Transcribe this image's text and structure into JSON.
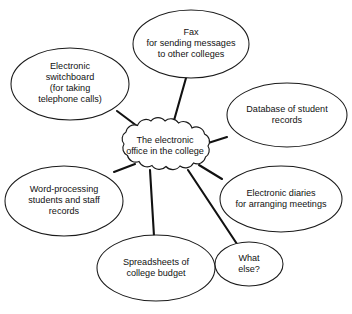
{
  "diagram": {
    "type": "spider-diagram",
    "title": "The electronic office in the college",
    "center": {
      "id": "center-cloud",
      "shape": "cloud",
      "lines": [
        "The electronic",
        "office in the college"
      ],
      "cx": 165,
      "cy": 146,
      "rx": 53,
      "ry": 24
    },
    "nodes": [
      {
        "id": "electronic-switchboard",
        "shape": "ellipse",
        "lines": [
          "Electronic",
          "switchboard",
          "(for taking",
          "telephone calls)"
        ],
        "cx": 70,
        "cy": 84,
        "rx": 59,
        "ry": 36
      },
      {
        "id": "fax",
        "shape": "ellipse",
        "lines": [
          "Fax",
          "for sending messages",
          "to other colleges"
        ],
        "cx": 191,
        "cy": 44,
        "rx": 58,
        "ry": 34
      },
      {
        "id": "database-of-student-records",
        "shape": "ellipse",
        "lines": [
          "Database of student",
          "records"
        ],
        "cx": 287,
        "cy": 115,
        "rx": 60,
        "ry": 32
      },
      {
        "id": "word-processing",
        "shape": "ellipse",
        "lines": [
          "Word-processing",
          "students and staff",
          "records"
        ],
        "cx": 64,
        "cy": 201,
        "rx": 59,
        "ry": 35
      },
      {
        "id": "electronic-diaries",
        "shape": "ellipse",
        "lines": [
          "Electronic diaries",
          "for arranging meetings"
        ],
        "cx": 281,
        "cy": 199,
        "rx": 61,
        "ry": 33
      },
      {
        "id": "spreadsheets",
        "shape": "ellipse",
        "lines": [
          "Spreadsheets of",
          "college budget"
        ],
        "cx": 156,
        "cy": 268,
        "rx": 59,
        "ry": 33
      },
      {
        "id": "what-else",
        "shape": "ellipse",
        "lines": [
          "What",
          "else?"
        ],
        "cx": 249,
        "cy": 264,
        "rx": 34,
        "ry": 22
      }
    ],
    "connectors": [
      {
        "id": "link-switchboard",
        "from": "electronic-switchboard",
        "x1": 117,
        "y1": 111,
        "x2": 137,
        "y2": 126
      },
      {
        "id": "link-fax",
        "from": "fax",
        "x1": 186,
        "y1": 78,
        "x2": 173,
        "y2": 124
      },
      {
        "id": "link-database",
        "from": "database-of-student-records",
        "x1": 227,
        "y1": 137,
        "x2": 205,
        "y2": 144
      },
      {
        "id": "link-word-processing",
        "from": "word-processing",
        "x1": 114,
        "y1": 172,
        "x2": 135,
        "y2": 164
      },
      {
        "id": "link-diaries",
        "from": "electronic-diaries",
        "x1": 222,
        "y1": 179,
        "x2": 199,
        "y2": 165
      },
      {
        "id": "link-spreadsheets",
        "from": "spreadsheets",
        "x1": 154,
        "y1": 236,
        "x2": 150,
        "y2": 170
      },
      {
        "id": "link-what-else",
        "from": "what-else",
        "x1": 237,
        "y1": 244,
        "x2": 188,
        "y2": 170
      }
    ],
    "colors": {
      "background": "#ffffff",
      "stroke": "#1a1a1a",
      "connector": "#111111",
      "text": "#111111"
    }
  }
}
